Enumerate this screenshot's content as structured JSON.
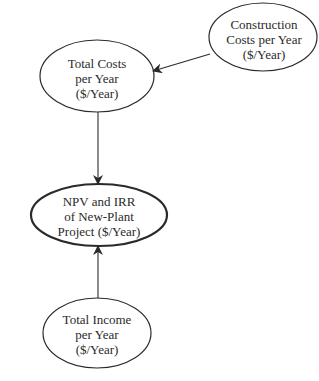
{
  "diagram": {
    "type": "influence-diagram",
    "colors": {
      "stroke": "#2a2a2a",
      "text": "#2a2a2a",
      "background": "#ffffff"
    },
    "nodes": [
      {
        "id": "construction",
        "lines": [
          "Construction",
          "Costs per Year",
          "($/Year)"
        ]
      },
      {
        "id": "total_costs",
        "lines": [
          "Total Costs",
          "per Year",
          "($/Year)"
        ]
      },
      {
        "id": "npv_irr",
        "lines": [
          "NPV and IRR",
          "of New-Plant",
          "Project ($/Year)"
        ]
      },
      {
        "id": "total_income",
        "lines": [
          "Total Income",
          "per Year",
          "($/Year)"
        ]
      }
    ],
    "edges": [
      {
        "from": "construction",
        "to": "total_costs"
      },
      {
        "from": "total_costs",
        "to": "npv_irr"
      },
      {
        "from": "total_income",
        "to": "npv_irr"
      }
    ]
  }
}
